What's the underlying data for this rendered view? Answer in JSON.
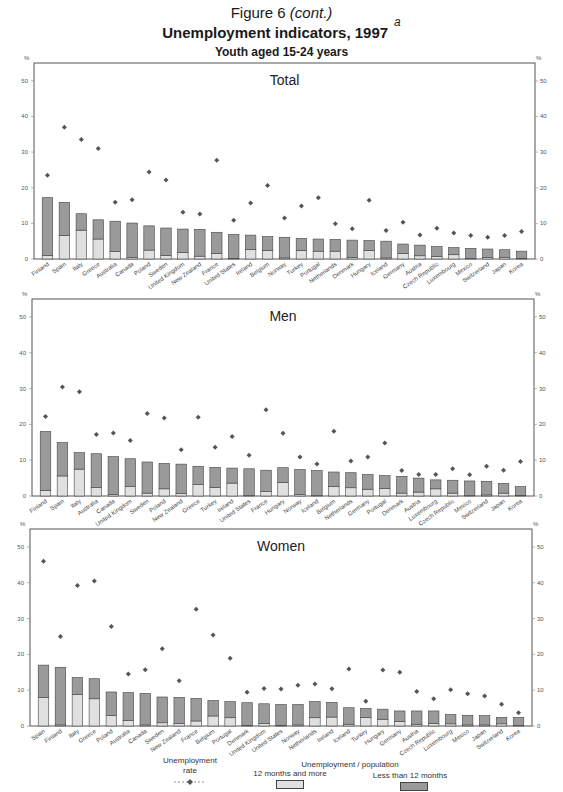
{
  "header": {
    "figure_label": "Figure 6",
    "figure_cont": "(cont.)",
    "title": "Unemployment indicators, 1997",
    "title_note": "a",
    "subtitle": "Youth aged 15-24 years"
  },
  "colors": {
    "long_term": "#e0e0e0",
    "short_term": "#9a9a9a",
    "marker": "#555555",
    "frame": "#555555"
  },
  "legend": {
    "rate_label_1": "Unemployment",
    "rate_label_2": "rate",
    "pop_label": "Unemployment / population",
    "long_term_label": "12 months and more",
    "short_term_label": "Less than 12 months"
  },
  "chart_data": [
    {
      "type": "bar",
      "stacked": true,
      "title": "Total",
      "ylabel": "%",
      "ylim": [
        0,
        55
      ],
      "yticks": [
        0,
        10,
        20,
        30,
        40,
        50
      ],
      "grid": false,
      "legend_position": "bottom",
      "categories": [
        "Finland",
        "Spain",
        "Italy",
        "Greece",
        "Australia",
        "Canada",
        "Poland",
        "Sweden",
        "United Kingdom",
        "New Zealand",
        "France",
        "United States",
        "Ireland",
        "Belgium",
        "Norway",
        "Turkey",
        "Portugal",
        "Netherlands",
        "Denmark",
        "Hungary",
        "Iceland",
        "Germany",
        "Austria",
        "Czech Republic",
        "Luxembourg",
        "Mexico",
        "Switzerland",
        "Japan",
        "Korea"
      ],
      "series": [
        {
          "name": "12 months and more",
          "values": [
            1.0,
            6.6,
            8.1,
            5.6,
            2.1,
            0.4,
            2.5,
            1.0,
            1.8,
            0.8,
            1.5,
            0.2,
            2.7,
            2.4,
            0.3,
            2.4,
            2.2,
            2.2,
            0.4,
            2.4,
            0.3,
            1.6,
            0.9,
            0.7,
            1.2,
            0.1,
            0.4,
            0.5,
            0.2
          ]
        },
        {
          "name": "Less than 12 months",
          "values": [
            16.2,
            9.3,
            4.6,
            5.4,
            8.5,
            9.7,
            6.8,
            7.7,
            6.6,
            7.5,
            6.0,
            6.7,
            4.0,
            3.9,
            5.8,
            3.4,
            3.4,
            3.3,
            4.9,
            2.8,
            4.7,
            2.6,
            3.0,
            2.8,
            2.0,
            2.9,
            2.4,
            2.1,
            2.0
          ]
        },
        {
          "name": "Unemployment rate",
          "values": [
            23.5,
            37.0,
            33.5,
            31.0,
            15.9,
            16.6,
            24.4,
            22.2,
            13.1,
            12.6,
            27.7,
            10.9,
            15.7,
            20.6,
            11.5,
            14.9,
            17.2,
            9.9,
            8.5,
            16.5,
            8.0,
            10.3,
            6.7,
            8.6,
            7.3,
            6.6,
            6.1,
            6.6,
            7.7
          ]
        }
      ]
    },
    {
      "type": "bar",
      "stacked": true,
      "title": "Men",
      "ylabel": "%",
      "ylim": [
        0,
        55
      ],
      "yticks": [
        0,
        10,
        20,
        30,
        40,
        50
      ],
      "grid": false,
      "legend_position": "bottom",
      "categories": [
        "Finland",
        "Spain",
        "Italy",
        "Australia",
        "Canada",
        "United Kingdom",
        "Sweden",
        "Poland",
        "New Zealand",
        "Greece",
        "Turkey",
        "Ireland",
        "United States",
        "France",
        "Hungary",
        "Norway",
        "Iceland",
        "Belgium",
        "Netherlands",
        "Germany",
        "Portugal",
        "Denmark",
        "Austria",
        "Luxembourg",
        "Czech Republic",
        "Mexico",
        "Switzerland",
        "Japan",
        "Korea"
      ],
      "series": [
        {
          "name": "12 months and more",
          "values": [
            1.6,
            5.6,
            7.5,
            2.4,
            0.4,
            2.6,
            0.8,
            2.0,
            0.7,
            3.2,
            2.4,
            3.6,
            0.1,
            1.2,
            3.8,
            0.4,
            0.1,
            2.7,
            2.3,
            1.9,
            2.1,
            0.8,
            1.1,
            2.0,
            0.8,
            0.1,
            0.3,
            0.8,
            0.2
          ]
        },
        {
          "name": "Less than 12 months",
          "values": [
            16.4,
            9.3,
            4.6,
            9.4,
            10.6,
            7.8,
            8.7,
            7.1,
            8.2,
            5.1,
            5.6,
            4.2,
            7.5,
            6.0,
            4.1,
            7.0,
            7.0,
            4.0,
            4.2,
            4.1,
            3.6,
            4.7,
            3.9,
            2.5,
            3.6,
            4.1,
            3.8,
            2.7,
            2.4
          ]
        },
        {
          "name": "Unemployment rate",
          "values": [
            22.2,
            30.4,
            29.1,
            17.2,
            17.6,
            15.5,
            23.0,
            21.8,
            12.9,
            22.0,
            13.6,
            16.6,
            11.4,
            24.1,
            17.5,
            10.9,
            8.9,
            18.1,
            9.8,
            10.9,
            14.8,
            7.1,
            6.0,
            6.0,
            7.6,
            5.9,
            8.3,
            7.2,
            9.6
          ]
        }
      ]
    },
    {
      "type": "bar",
      "stacked": true,
      "title": "Women",
      "ylabel": "%",
      "ylim": [
        0,
        55
      ],
      "yticks": [
        0,
        10,
        20,
        30,
        40,
        50
      ],
      "grid": false,
      "legend_position": "bottom",
      "categories": [
        "Spain",
        "Finland",
        "Italy",
        "Greece",
        "Poland",
        "Australia",
        "Canada",
        "Sweden",
        "New Zealand",
        "France",
        "Belgium",
        "Portugal",
        "Denmark",
        "United Kingdom",
        "United States",
        "Norway",
        "Netherlands",
        "Ireland",
        "Iceland",
        "Turkey",
        "Hungary",
        "Germany",
        "Austria",
        "Czech Republic",
        "Luxembourg",
        "Mexico",
        "Japan",
        "Switzerland",
        "Korea"
      ],
      "series": [
        {
          "name": "12 months and more",
          "values": [
            7.9,
            0.3,
            8.8,
            7.6,
            2.9,
            1.6,
            0.3,
            0.9,
            0.7,
            1.4,
            2.8,
            2.3,
            0.2,
            0.7,
            0.2,
            0.3,
            2.3,
            2.5,
            0.5,
            2.4,
            1.9,
            1.3,
            0.5,
            0.7,
            0.6,
            0.3,
            0.3,
            0.6,
            0.2
          ]
        },
        {
          "name": "Less than 12 months",
          "values": [
            9.1,
            16.1,
            4.7,
            5.6,
            6.6,
            7.7,
            8.8,
            7.2,
            7.3,
            6.3,
            4.3,
            4.5,
            6.3,
            5.5,
            5.8,
            5.7,
            4.5,
            4.1,
            4.6,
            2.5,
            2.8,
            2.9,
            3.7,
            3.5,
            2.6,
            2.7,
            2.6,
            1.8,
            2.2
          ]
        },
        {
          "name": "Unemployment rate",
          "values": [
            46.0,
            25.0,
            39.2,
            40.5,
            27.8,
            14.5,
            15.7,
            21.6,
            12.6,
            32.6,
            25.4,
            18.9,
            9.4,
            10.5,
            10.3,
            11.4,
            11.7,
            10.4,
            15.9,
            6.9,
            15.6,
            15.0,
            9.6,
            7.6,
            10.1,
            9.0,
            8.4,
            6.1,
            3.7
          ]
        }
      ]
    }
  ]
}
